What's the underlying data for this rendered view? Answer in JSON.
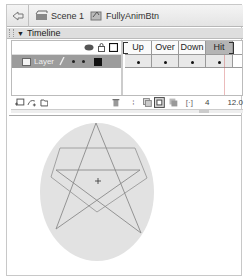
{
  "editbar": {
    "back_icon": "back-arrow-icon",
    "breadcrumbs": [
      {
        "label": "Scene 1",
        "icon": "scene-clapboard-icon"
      },
      {
        "label": "FullyAnimBtn",
        "icon": "button-symbol-icon"
      }
    ]
  },
  "timeline": {
    "title": "Timeline",
    "header_icons": [
      "eye-icon",
      "lock-icon",
      "outline-icon"
    ],
    "layers": [
      {
        "name": "Layer",
        "visible": true,
        "locked": false,
        "outline_color": "#111111"
      }
    ],
    "frame_labels": [
      "Up",
      "Over",
      "Down",
      "Hit"
    ],
    "current_frame": "4",
    "fps": "12.0",
    "footer_icons": [
      "add-layer-icon",
      "add-motion-guide-icon",
      "add-folder-icon",
      "delete-icon",
      "center-frame-icon",
      "onion-skin-icon",
      "onion-outline-icon",
      "edit-multiple-icon",
      "modify-markers-icon"
    ]
  },
  "stage": {
    "ellipse_color": "#e2e2e2",
    "stroke_color": "#8a8a8a"
  }
}
